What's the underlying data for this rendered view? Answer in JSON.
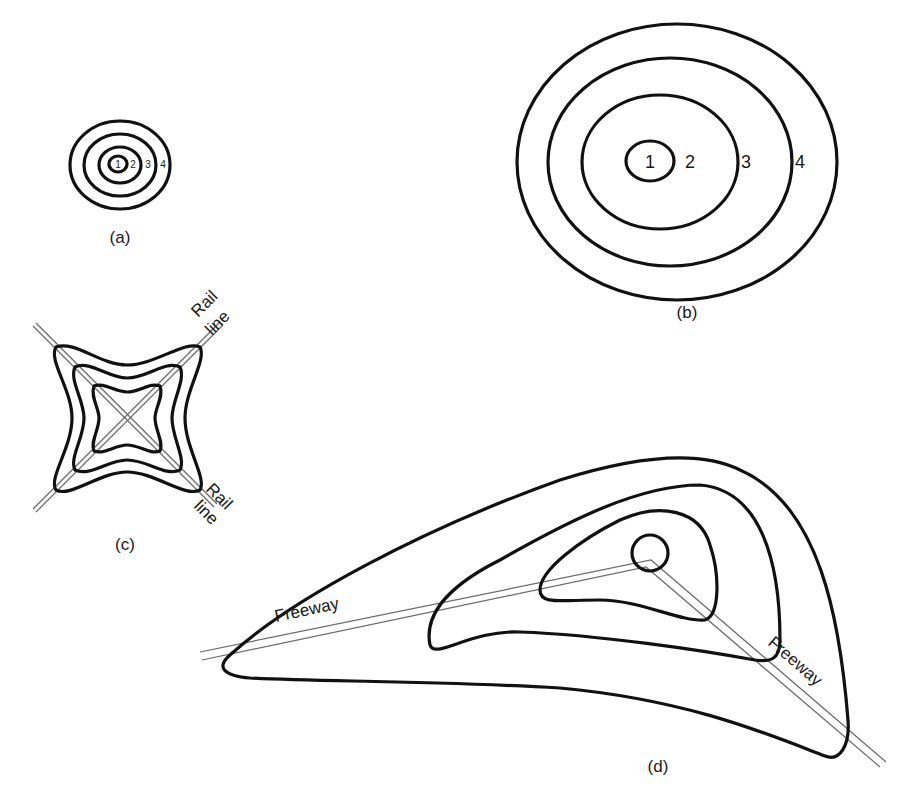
{
  "figure": {
    "panels": [
      {
        "id": "a",
        "caption": "(a)",
        "description": "Small concentric contour zones",
        "zone_labels": [
          "1",
          "2",
          "3",
          "4"
        ]
      },
      {
        "id": "b",
        "caption": "(b)",
        "description": "Large concentric contour zones",
        "zone_labels": [
          "1",
          "2",
          "3",
          "4"
        ]
      },
      {
        "id": "c",
        "caption": "(c)",
        "description": "Star-shaped contours elongated along crossing rail lines",
        "feature_labels": [
          {
            "line1": "Rail",
            "line2": "line"
          },
          {
            "line1": "Rail",
            "line2": "line"
          }
        ]
      },
      {
        "id": "d",
        "caption": "(d)",
        "description": "Asymmetric contours elongated along a bent freeway",
        "feature_labels": [
          "Freeway",
          "Freeway"
        ]
      }
    ],
    "colors": {
      "contour": "#111111",
      "road": "#6b6b6b",
      "text": "#1a1a1a",
      "background": "#ffffff"
    }
  }
}
